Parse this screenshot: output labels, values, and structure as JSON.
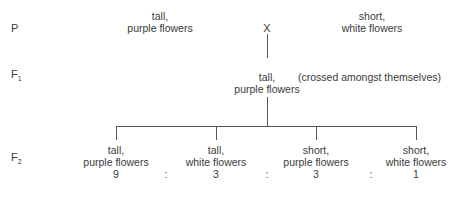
{
  "generations": {
    "p": "P",
    "f1": "F",
    "f1_sub": "1",
    "f2": "F",
    "f2_sub": "2"
  },
  "parents": {
    "left": {
      "line1": "tall,",
      "line2": "purple flowers"
    },
    "cross_symbol": "X",
    "right": {
      "line1": "short,",
      "line2": "white flowers"
    }
  },
  "f1": {
    "line1": "tall,",
    "line2": "purple flowers",
    "note": "(crossed amongst themselves)"
  },
  "f2": {
    "offspring": [
      {
        "line1": "tall,",
        "line2": "purple flowers",
        "ratio": "9"
      },
      {
        "line1": "tall,",
        "line2": "white flowers",
        "ratio": "3"
      },
      {
        "line1": "short,",
        "line2": "purple flowers",
        "ratio": "3"
      },
      {
        "line1": "short,",
        "line2": "white flowers",
        "ratio": "1"
      }
    ],
    "separator": ":"
  }
}
